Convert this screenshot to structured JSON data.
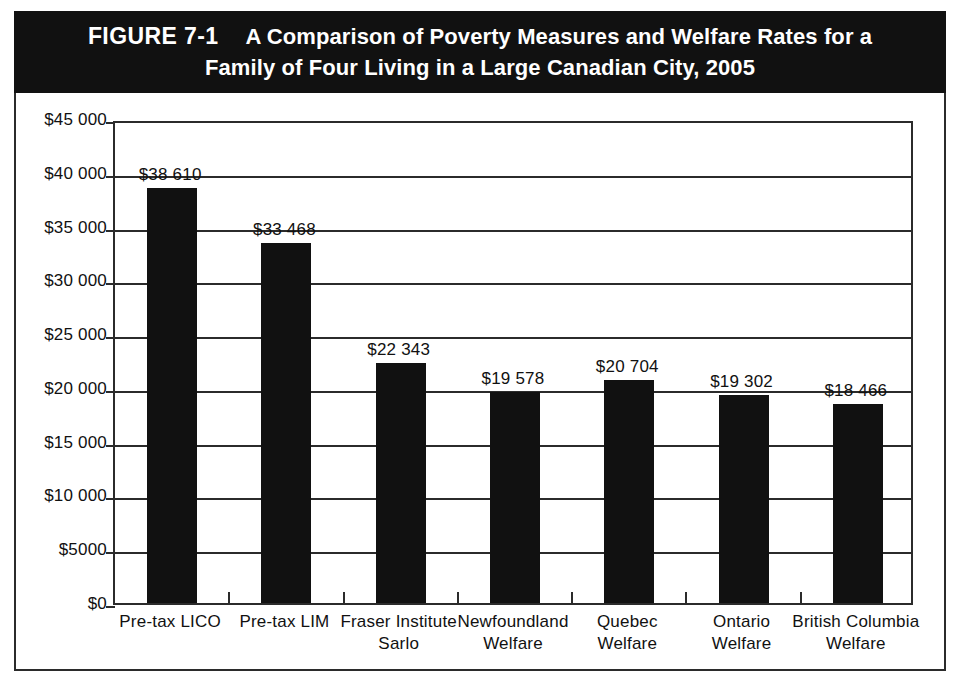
{
  "figure": {
    "label": "FIGURE 7-1",
    "title_line_1": "A Comparison of Poverty Measures and Welfare Rates for a",
    "title_line_2": "Family of Four Living in a Large Canadian City, 2005",
    "banner_color": "#111111",
    "banner_text_color": "#ffffff",
    "frame_color": "#2b2b2b"
  },
  "chart_data": {
    "type": "bar",
    "title": "A Comparison of Poverty Measures and Welfare Rates for a Family of Four Living in a Large Canadian City, 2005",
    "xlabel": "",
    "ylabel": "",
    "ylim": [
      0,
      45000
    ],
    "ytick_step": 5000,
    "grid": true,
    "legend": "none",
    "bar_color": "#111111",
    "categories": [
      "Pre-tax LICO",
      "Pre-tax LIM",
      "Fraser Institute Sarlo",
      "Newfoundland Welfare",
      "Quebec Welfare",
      "Ontario Welfare",
      "British Columbia Welfare"
    ],
    "category_lines": [
      [
        "Pre-tax LICO"
      ],
      [
        "Pre-tax LIM"
      ],
      [
        "Fraser Institute",
        "Sarlo"
      ],
      [
        "Newfoundland",
        "Welfare"
      ],
      [
        "Quebec",
        "Welfare"
      ],
      [
        "Ontario",
        "Welfare"
      ],
      [
        "British Columbia",
        "Welfare"
      ]
    ],
    "values": [
      38610,
      33468,
      22343,
      19578,
      20704,
      19302,
      18466
    ],
    "value_labels": [
      "$38 610",
      "$33 468",
      "$22 343",
      "$19 578",
      "$20 704",
      "$19 302",
      "$18 466"
    ],
    "ytick_values": [
      45000,
      40000,
      35000,
      30000,
      25000,
      20000,
      15000,
      10000,
      5000,
      0
    ],
    "ytick_labels": [
      "$45 000",
      "$40 000",
      "$35 000",
      "$30 000",
      "$25 000",
      "$20 000",
      "$15 000",
      "$10 000",
      "$5000",
      "$0"
    ]
  }
}
